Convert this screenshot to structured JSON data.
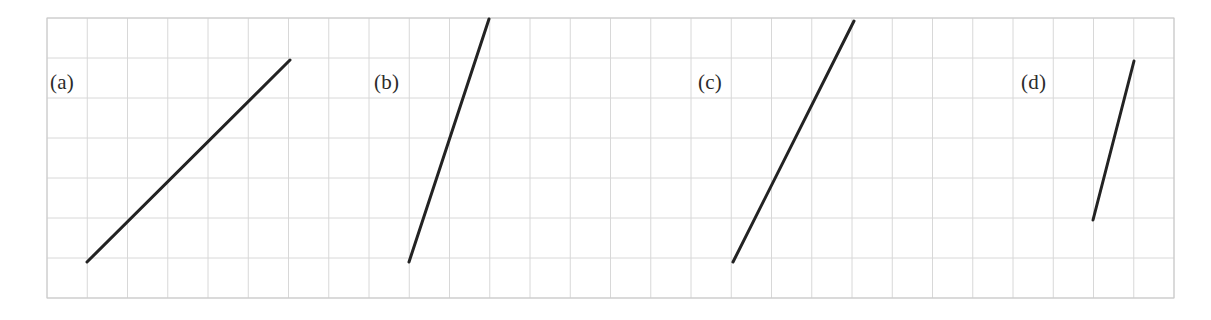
{
  "figure": {
    "width": 1211,
    "height": 320,
    "background_color": "#ffffff",
    "caption_labels": [
      "(a)",
      "(b)",
      "(c)",
      "(d)"
    ]
  },
  "grid": {
    "left": 47,
    "top": 18,
    "right": 1174,
    "bottom": 298,
    "columns": 28,
    "rows": 7,
    "cell_width": 40.25,
    "cell_height": 40,
    "line_color": "#d8d8d8",
    "border_color": "#c9c9c9",
    "visible": true
  },
  "chart_data": {
    "type": "line",
    "title": "",
    "subtitle": "",
    "xlabel": "",
    "ylabel": "",
    "grid": true,
    "legend_position": "none",
    "xlim": [
      0,
      28
    ],
    "ylim": [
      0,
      7
    ],
    "tick_labels_x": [],
    "tick_labels_y": [],
    "series": [
      {
        "name": "(a)",
        "label": "(a)",
        "color": "#232323",
        "stroke_width": 3,
        "x": [
          1.0,
          6.04
        ],
        "y": [
          0.9,
          5.95
        ],
        "slope": 1.0,
        "pixel_start": [
          87,
          262
        ],
        "pixel_end": [
          290,
          60
        ]
      },
      {
        "name": "(b)",
        "label": "(b)",
        "color": "#232323",
        "stroke_width": 3,
        "x": [
          9.0,
          11.0
        ],
        "y": [
          0.9,
          6.98
        ],
        "slope": 3.0,
        "pixel_start": [
          409,
          262
        ],
        "pixel_end": [
          489,
          19
        ]
      },
      {
        "name": "(c)",
        "label": "(c)",
        "color": "#232323",
        "stroke_width": 3,
        "x": [
          17.05,
          20.05
        ],
        "y": [
          0.9,
          6.93
        ],
        "slope": 2.0,
        "pixel_start": [
          733,
          262
        ],
        "pixel_end": [
          854,
          21
        ]
      },
      {
        "name": "(d)",
        "label": "(d)",
        "color": "#232323",
        "stroke_width": 3,
        "x": [
          25.99,
          27.01
        ],
        "y": [
          1.95,
          5.93
        ],
        "slope": 4.0,
        "pixel_start": [
          1093,
          220
        ],
        "pixel_end": [
          1134,
          61
        ]
      }
    ],
    "annotations": [
      {
        "text": "(a)",
        "pixel_x": 50,
        "pixel_y": 72
      },
      {
        "text": "(b)",
        "pixel_x": 374,
        "pixel_y": 72
      },
      {
        "text": "(c)",
        "pixel_x": 698,
        "pixel_y": 72
      },
      {
        "text": "(d)",
        "pixel_x": 1021,
        "pixel_y": 72
      }
    ]
  }
}
